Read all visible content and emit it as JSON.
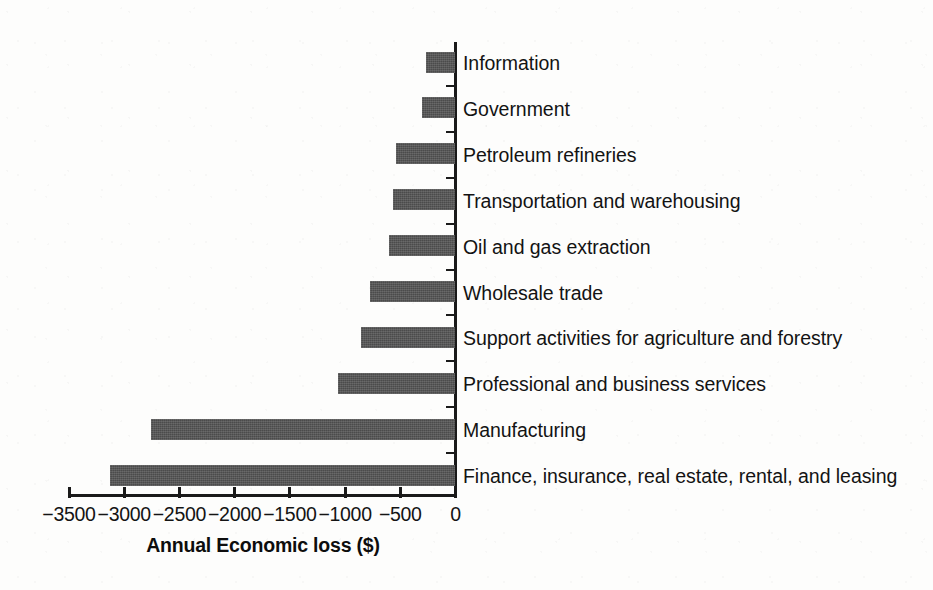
{
  "chart_data": {
    "type": "bar",
    "orientation": "horizontal",
    "title": "",
    "subtitle": "",
    "xlabel": "Annual Economic loss ($)",
    "ylabel": "",
    "grid": false,
    "legend": null,
    "xlim": [
      -3500,
      0
    ],
    "xticks": [
      -3500,
      -3000,
      -2500,
      -2000,
      -1500,
      -1000,
      -500,
      0
    ],
    "xtick_labels": [
      "−3500",
      "−3000",
      "−2500",
      "−2000",
      "−1500",
      "−1000",
      "−500",
      "0"
    ],
    "bar_color": "#4b4b4b",
    "axis_color": "#1a1a1a",
    "categories": [
      "Information",
      "Government",
      "Petroleum refineries",
      "Transportation and warehousing",
      "Oil and gas extraction",
      "Wholesale trade",
      "Support activities for agriculture and forestry",
      "Professional and business services",
      "Manufacturing",
      "Finance, insurance, real estate, rental, and leasing"
    ],
    "values": [
      -270,
      -300,
      -540,
      -570,
      -600,
      -770,
      -860,
      -1060,
      -2760,
      -3130
    ]
  }
}
